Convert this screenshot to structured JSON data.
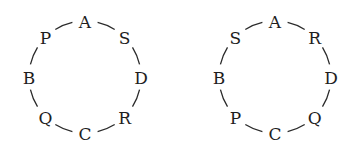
{
  "diagrams": [
    {
      "id": "left",
      "center": [
        85,
        77
      ],
      "radius": 56,
      "nodes": [
        {
          "label": "A",
          "angle": -90
        },
        {
          "label": "S",
          "angle": -45
        },
        {
          "label": "D",
          "angle": 0
        },
        {
          "label": "R",
          "angle": 45
        },
        {
          "label": "C",
          "angle": 90
        },
        {
          "label": "Q",
          "angle": 135
        },
        {
          "label": "B",
          "angle": 180
        },
        {
          "label": "P",
          "angle": 225
        }
      ]
    },
    {
      "id": "right",
      "center": [
        275,
        77
      ],
      "radius": 56,
      "nodes": [
        {
          "label": "A",
          "angle": -90
        },
        {
          "label": "R",
          "angle": -45
        },
        {
          "label": "D",
          "angle": 0
        },
        {
          "label": "Q",
          "angle": 45
        },
        {
          "label": "C",
          "angle": 90
        },
        {
          "label": "P",
          "angle": 135
        },
        {
          "label": "B",
          "angle": 180
        },
        {
          "label": "S",
          "angle": 225
        }
      ]
    }
  ]
}
